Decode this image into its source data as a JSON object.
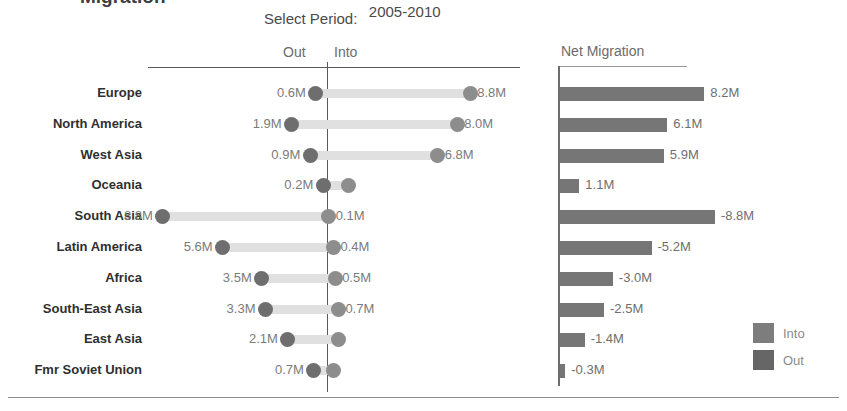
{
  "title_clipped": "Migration",
  "controls": {
    "period_label": "Select Period:",
    "period_value": "2005-2010"
  },
  "headers": {
    "out": "Out",
    "into": "Into",
    "net": "Net Migration"
  },
  "legend": [
    {
      "label": "Into",
      "color": "#7d7d7d"
    },
    {
      "label": "Out",
      "color": "#666666"
    }
  ],
  "chart_data": {
    "type": "bar",
    "title": "Migration",
    "subtitle": "2005-2010",
    "xlabel": "",
    "ylabel": "",
    "grid": false,
    "legend_position": "bottom-right",
    "units": "millions",
    "panels": [
      {
        "name": "dumbbell",
        "type": "dumbbell",
        "series": [
          {
            "name": "Out",
            "color": "#6e6e6e"
          },
          {
            "name": "Into",
            "color": "#8d8d8d"
          }
        ],
        "axis_note": "zero line between Out (left) and Into (right)"
      },
      {
        "name": "net-migration",
        "type": "bar",
        "header": "Net Migration",
        "note": "bar length encodes absolute magnitude; sign shown in label"
      }
    ],
    "categories": [
      "Europe",
      "North America",
      "West Asia",
      "Oceania",
      "South Asia",
      "Latin America",
      "Africa",
      "South-East Asia",
      "East Asia",
      "Fmr Soviet Union"
    ],
    "rows": [
      {
        "region": "Europe",
        "out": 0.6,
        "into": 8.8,
        "net": 8.2,
        "out_label": "0.6M",
        "into_label": "8.8M",
        "net_label": "8.2M"
      },
      {
        "region": "North America",
        "out": 1.9,
        "into": 8.0,
        "net": 6.1,
        "out_label": "1.9M",
        "into_label": "8.0M",
        "net_label": "6.1M"
      },
      {
        "region": "West Asia",
        "out": 0.9,
        "into": 6.8,
        "net": 5.9,
        "out_label": "0.9M",
        "into_label": "6.8M",
        "net_label": "5.9M"
      },
      {
        "region": "Oceania",
        "out": 0.2,
        "into": 1.3,
        "net": 1.1,
        "out_label": "0.2M",
        "into_label": "",
        "net_label": "1.1M"
      },
      {
        "region": "South Asia",
        "out": 8.8,
        "into": 0.1,
        "net": -8.8,
        "out_label": "8.8M",
        "into_label": "0.1M",
        "net_label": "-8.8M"
      },
      {
        "region": "Latin America",
        "out": 5.6,
        "into": 0.4,
        "net": -5.2,
        "out_label": "5.6M",
        "into_label": "0.4M",
        "net_label": "-5.2M"
      },
      {
        "region": "Africa",
        "out": 3.5,
        "into": 0.5,
        "net": -3.0,
        "out_label": "3.5M",
        "into_label": "0.5M",
        "net_label": "-3.0M"
      },
      {
        "region": "South-East Asia",
        "out": 3.3,
        "into": 0.7,
        "net": -2.5,
        "out_label": "3.3M",
        "into_label": "0.7M",
        "net_label": "-2.5M"
      },
      {
        "region": "East Asia",
        "out": 2.1,
        "into": 0.7,
        "net": -1.4,
        "out_label": "2.1M",
        "into_label": "",
        "net_label": "-1.4M"
      },
      {
        "region": "Fmr Soviet Union",
        "out": 0.7,
        "into": 0.4,
        "net": -0.3,
        "out_label": "0.7M",
        "into_label": "",
        "net_label": "-0.3M"
      }
    ]
  }
}
